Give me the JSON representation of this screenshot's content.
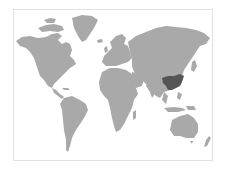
{
  "map": {
    "type": "world-choropleth",
    "projection": "equirectangular-like",
    "colors": {
      "background": "#ffffff",
      "frame_border": "#e2e2e2",
      "land": "#a9a9a9",
      "highlight": "#555555"
    },
    "highlighted_regions": [
      {
        "name": "Southern China"
      }
    ]
  }
}
